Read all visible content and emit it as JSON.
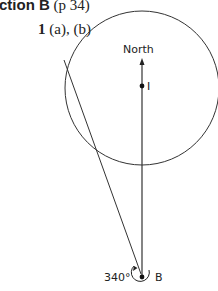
{
  "header": {
    "section_prefix": "ction B",
    "page_ref": "(p 34)"
  },
  "question": {
    "number": "1",
    "parts": "(a), (b)"
  },
  "diagram": {
    "north_label": "North",
    "point_i_label": "I",
    "point_b_label": "B",
    "bearing_label": "340°"
  }
}
